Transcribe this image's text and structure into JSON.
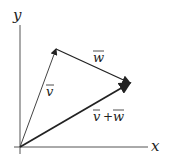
{
  "diagram": {
    "axes": {
      "x_label": "x",
      "y_label": "y"
    },
    "vectors": [
      {
        "name": "v",
        "label": "v⃗",
        "from": [
          20,
          147
        ],
        "to": [
          56,
          49
        ]
      },
      {
        "name": "w",
        "label": "w⃗",
        "from": [
          56,
          49
        ],
        "to": [
          130,
          83
        ]
      },
      {
        "name": "v+w",
        "label": "v⃗ + w⃗",
        "from": [
          20,
          147
        ],
        "to": [
          130,
          83
        ]
      }
    ],
    "labels": {
      "v": "v",
      "w": "w",
      "sum_v": "v",
      "sum_plus": "+",
      "sum_w": "w"
    },
    "colors": {
      "stroke": "#333333",
      "axis": "#555555"
    }
  }
}
